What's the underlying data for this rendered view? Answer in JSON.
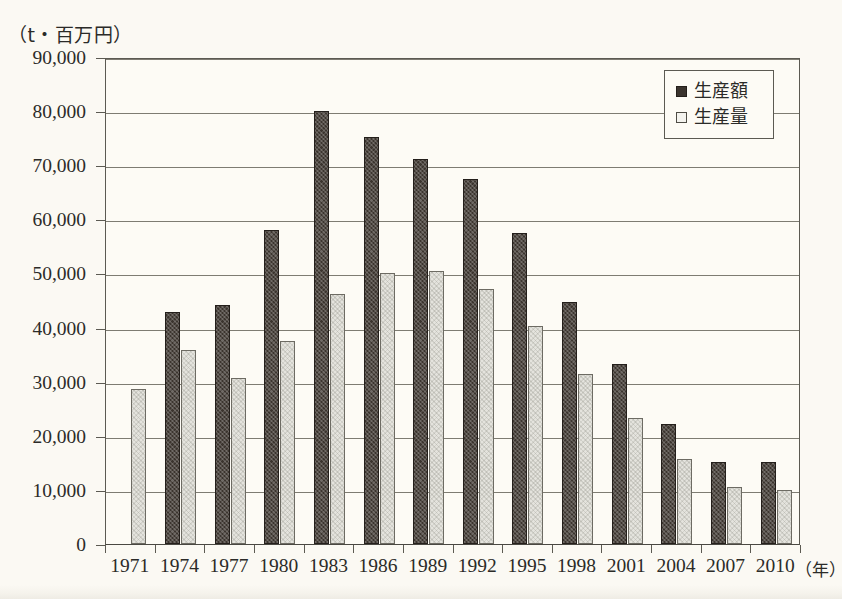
{
  "chart_data": {
    "type": "bar",
    "title": "",
    "subtitle": "",
    "xlabel": "（年）",
    "ylabel": "（t・百万円）",
    "ylim": [
      0,
      90000
    ],
    "ytick_labels": [
      "90,000",
      "80,000",
      "70,000",
      "60,000",
      "50,000",
      "40,000",
      "30,000",
      "20,000",
      "10,000",
      "0"
    ],
    "ytick_values": [
      90000,
      80000,
      70000,
      60000,
      50000,
      40000,
      30000,
      20000,
      10000,
      0
    ],
    "grid": true,
    "legend_position": "top-right",
    "categories": [
      "1971",
      "1974",
      "1977",
      "1980",
      "1983",
      "1986",
      "1989",
      "1992",
      "1995",
      "1998",
      "2001",
      "2004",
      "2007",
      "2010"
    ],
    "series": [
      {
        "name": "生産額",
        "style": "dark-checkered",
        "color": "#3b342e",
        "values": [
          null,
          42800,
          44100,
          58000,
          80000,
          75200,
          71200,
          67500,
          57400,
          44800,
          33200,
          22200,
          15100,
          15200
        ]
      },
      {
        "name": "生産量",
        "style": "light-speckled",
        "color": "#e4e3dd",
        "values": [
          28600,
          35900,
          30600,
          37600,
          46200,
          50000,
          50400,
          47200,
          40300,
          31500,
          23300,
          15700,
          10600,
          10000
        ]
      }
    ]
  },
  "axis": {
    "y_unit_label": "（t・百万円）",
    "x_unit_label": "（年）"
  },
  "legend": {
    "items": [
      {
        "label": "生産額",
        "swatch": "dark-swatch"
      },
      {
        "label": "生産量",
        "swatch": "light-swatch"
      }
    ]
  },
  "colors": {
    "background": "#fbf9f3",
    "plot_background": "#fdfbf5",
    "axis": "#5c5a52",
    "grid": "#7e7c72",
    "series_dark": "#3b342e",
    "series_light": "#e4e3dd",
    "text": "#2b2b28"
  }
}
